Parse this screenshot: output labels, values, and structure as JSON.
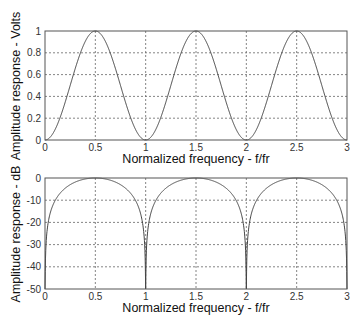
{
  "chart_data": [
    {
      "type": "line",
      "title": "",
      "xlabel": "Normalized frequency - f/fr",
      "ylabel": "Amplitude response - Volts",
      "xlim": [
        0,
        3
      ],
      "ylim": [
        0,
        1
      ],
      "xticks": [
        "0",
        "0.5",
        "1",
        "1.5",
        "2",
        "2.5",
        "3"
      ],
      "yticks": [
        "0",
        "0.2",
        "0.4",
        "0.6",
        "0.8",
        "1"
      ],
      "grid": true,
      "series": [
        {
          "name": "amplitude (linear)",
          "function": "sin^2(pi*x)",
          "x": [
            0,
            0.25,
            0.5,
            0.75,
            1.0,
            1.25,
            1.5,
            1.75,
            2.0,
            2.25,
            2.5,
            2.75,
            3.0
          ],
          "values": [
            0,
            0.5,
            1,
            0.5,
            0,
            0.5,
            1,
            0.5,
            0,
            0.5,
            1,
            0.5,
            0
          ]
        }
      ]
    },
    {
      "type": "line",
      "title": "",
      "xlabel": "Normalized frequency - f/fr",
      "ylabel": "Amplitude response - dB",
      "xlim": [
        0,
        3
      ],
      "ylim": [
        -50,
        0
      ],
      "xticks": [
        "0",
        "0.5",
        "1",
        "1.5",
        "2",
        "2.5",
        "3"
      ],
      "yticks": [
        "0",
        "-10",
        "-20",
        "-30",
        "-40",
        "-50"
      ],
      "grid": true,
      "series": [
        {
          "name": "amplitude (dB)",
          "function": "20*log10(sin^2(pi*x)) clipped at -50... displayed as 10*log10 power",
          "x": [
            0.1,
            0.25,
            0.5,
            0.75,
            0.9,
            1.0,
            1.1,
            1.5,
            1.9,
            2.0,
            2.1,
            2.5,
            2.9,
            3.0
          ],
          "values": [
            -10.2,
            -3.0,
            0,
            -3.0,
            -10.2,
            -50,
            -10.2,
            0,
            -10.2,
            -50,
            -10.2,
            0,
            -10.2,
            -50
          ]
        }
      ]
    }
  ],
  "top": {
    "ylabel": "Amplitude response - Volts",
    "xlabel": "Normalized frequency - f/fr",
    "xticks": [
      "0",
      "0.5",
      "1",
      "1.5",
      "2",
      "2.5",
      "3"
    ],
    "yticks": [
      "0",
      "0.2",
      "0.4",
      "0.6",
      "0.8",
      "1"
    ]
  },
  "bottom": {
    "ylabel": "Amplitude response - dB",
    "xlabel": "Normalized frequency - f/fr",
    "xticks": [
      "0",
      "0.5",
      "1",
      "1.5",
      "2",
      "2.5",
      "3"
    ],
    "yticks": [
      "0",
      "-10",
      "-20",
      "-30",
      "-40",
      "-50"
    ]
  }
}
